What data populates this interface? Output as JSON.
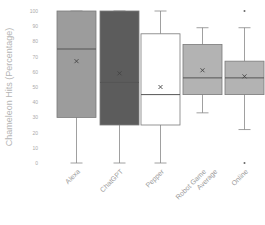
{
  "chart_data": {
    "type": "box",
    "title": "",
    "xlabel": "",
    "ylabel": "Chameleon Hits (Percentage)",
    "ylim": [
      0,
      100
    ],
    "yticks": [
      0,
      10,
      20,
      30,
      40,
      50,
      60,
      70,
      80,
      90,
      100
    ],
    "grid": false,
    "legend": null,
    "categories": [
      "Alexa",
      "ChatGPT",
      "Pepper",
      "Robot Game Average",
      "Online"
    ],
    "series": [
      {
        "name": "Alexa",
        "whisker_low": 0,
        "q1": 30,
        "median": 75,
        "q3": 100,
        "whisker_high": 100,
        "mean": 67,
        "outliers": [],
        "fill": "#9c9c9c"
      },
      {
        "name": "ChatGPT",
        "whisker_low": 0,
        "q1": 25,
        "median": 53,
        "q3": 100,
        "whisker_high": 100,
        "mean": 59,
        "outliers": [],
        "fill": "#5c5c5c"
      },
      {
        "name": "Pepper",
        "whisker_low": 0,
        "q1": 25,
        "median": 45,
        "q3": 85,
        "whisker_high": 100,
        "mean": 50,
        "outliers": [],
        "fill": "#ffffff"
      },
      {
        "name": "Robot Game Average",
        "whisker_low": 33,
        "q1": 45,
        "median": 56,
        "q3": 78,
        "whisker_high": 89,
        "mean": 61,
        "outliers": [],
        "fill": "#b3b3b3"
      },
      {
        "name": "Online",
        "whisker_low": 22,
        "q1": 45,
        "median": 56,
        "q3": 67,
        "whisker_high": 89,
        "mean": 57,
        "outliers": [
          100,
          0
        ],
        "fill": "#b3b3b3"
      }
    ]
  },
  "axis": {
    "ylabel": "Chameleon Hits (Percentage)",
    "tick_labels": [
      "100",
      "90",
      "80",
      "70",
      "60",
      "50",
      "40",
      "30",
      "20",
      "10",
      "0"
    ],
    "category_labels": [
      {
        "line1": "Alexa",
        "line2": ""
      },
      {
        "line1": "ChatGPT",
        "line2": ""
      },
      {
        "line1": "Pepper",
        "line2": ""
      },
      {
        "line1": "Robot Game",
        "line2": "Average"
      },
      {
        "line1": "Online",
        "line2": ""
      }
    ]
  }
}
